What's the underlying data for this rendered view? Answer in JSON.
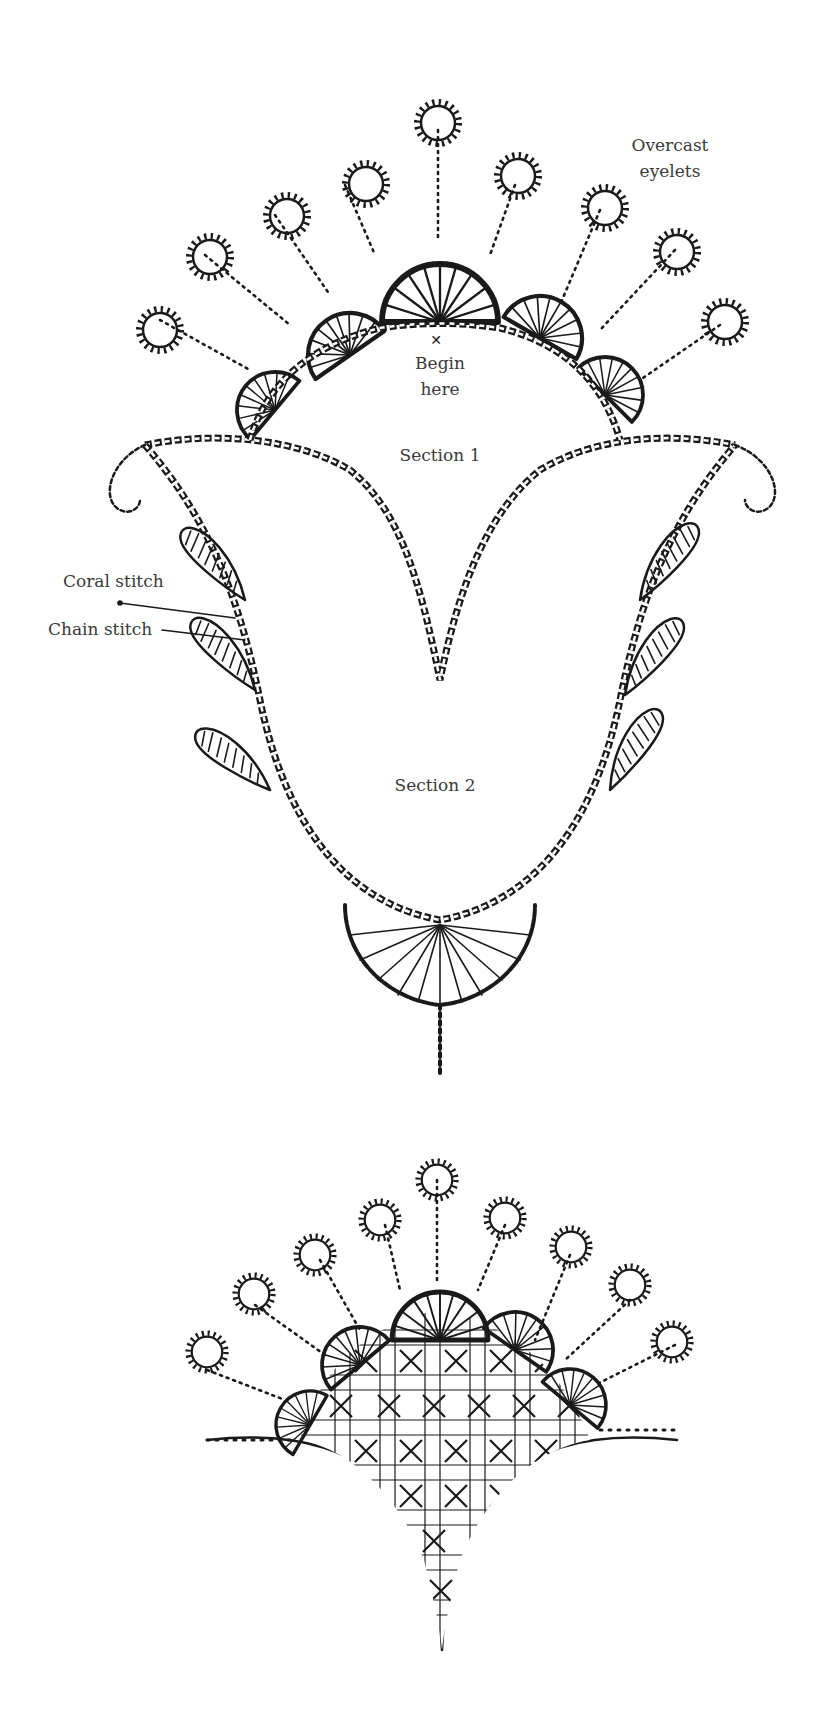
{
  "diagram": {
    "ink_color": "#1a1a1a",
    "label_color": "#3a3a3a",
    "labels": {
      "overcast_eyelets_line1": "Overcast",
      "overcast_eyelets_line2": "eyelets",
      "begin_here_line1": "Begin",
      "begin_here_line2": "here",
      "section_1": "Section 1",
      "section_2": "Section 2",
      "coral_stitch": "Coral stitch",
      "chain_stitch": "Chain stitch"
    },
    "figures": [
      {
        "name": "upper-tulip-motif",
        "sections": 2,
        "eyelets": 8,
        "fan_scallops": 6,
        "leaves": 6
      },
      {
        "name": "lower-fan-motif",
        "eyelets": 9,
        "fan_scallops": 5,
        "fill": "lattice-couching"
      }
    ]
  }
}
